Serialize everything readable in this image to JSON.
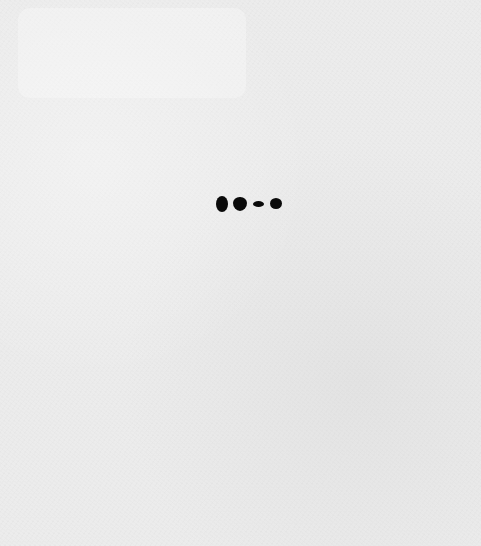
{
  "page": {
    "state": "loading",
    "background_color": "#ececec"
  },
  "loader": {
    "icon": "loading-dots-icon",
    "dot_count": 4,
    "dot_color": "#0a0a0a"
  }
}
